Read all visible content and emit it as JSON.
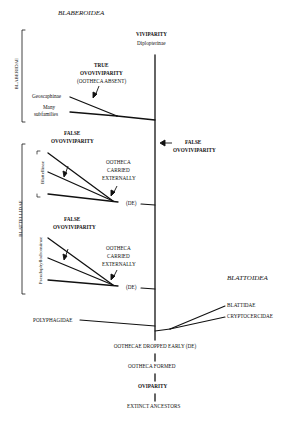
{
  "diagram": {
    "superfamilies": {
      "blaberoidea": "BLABEROIDEA",
      "blattoidea": "BLATTOIDEA"
    },
    "families": {
      "blaberidae": "BLABERIDAE",
      "blattellidae": "BLATTELLIDAE",
      "polyphagidae": "POLYPHAGIDAE",
      "blattidae": "BLATTIDAE",
      "cryptocercidae": "CRYPTOCERCIDAE"
    },
    "subfamilies": {
      "diploptera": "Diplopterinae",
      "geoscaphinae": "Geoscaphinae",
      "many_line1": "Many",
      "many_line2": "subfamilies",
      "blattellinae": "Blattellinae",
      "pseudophyllodromiinae": "Pseudophyllodromiinae"
    },
    "traits": {
      "viviparity": "VIVIPARITY",
      "true_ovo_line1": "TRUE",
      "true_ovo_line2": "OVOVIVIPARITY",
      "true_ovo_line3": "(OOTHECA ABSENT)",
      "false_ovo1_line1": "FALSE",
      "false_ovo1_line2": "OVOVIVIPARITY",
      "false_ovo2_line1": "FALSE",
      "false_ovo2_line2": "OVOVIVIPARITY",
      "false_ovo_main_line1": "FALSE",
      "false_ovo_main_line2": "OVOVIVIPARITY",
      "ext1_line1": "OOTHECA",
      "ext1_line2": "CARRIED",
      "ext1_line3": "EXTERNALLY",
      "ext2_line1": "OOTHECA",
      "ext2_line2": "CARRIED",
      "ext2_line3": "EXTERNALLY",
      "de1": "(DE)",
      "de2": "(DE)"
    },
    "base_sequence": {
      "dropped": "OOTHECAE DROPPED EARLY (DE)",
      "formed": "OOTHECA FORMED",
      "oviparity": "OVIPARITY",
      "ancestors": "EXTINCT ANCESTORS"
    }
  }
}
